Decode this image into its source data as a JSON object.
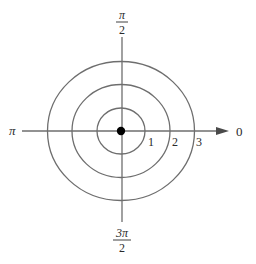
{
  "diagram": {
    "type": "polar-coordinate-grid",
    "angle_labels": {
      "right": "0",
      "top": {
        "numerator": "π",
        "denominator": "2"
      },
      "left": "π",
      "bottom": {
        "numerator": "3π",
        "denominator": "2"
      }
    },
    "radius_labels": [
      "1",
      "2",
      "3"
    ],
    "circles": [
      {
        "r": 1
      },
      {
        "r": 2
      },
      {
        "r": 3
      }
    ],
    "pole": {
      "marker": "filled-dot"
    },
    "colors": {
      "line": "#6e6e6e",
      "text": "#2a2a2a",
      "dot": "#000000",
      "background": "#ffffff"
    }
  }
}
